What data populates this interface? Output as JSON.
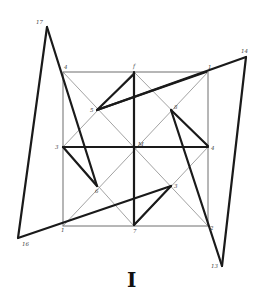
{
  "figure": {
    "caption": "I",
    "colors": {
      "thin_line": "#8a8a8a",
      "thick_line": "#1a1a1a",
      "label": "#444444",
      "background": "#ffffff"
    },
    "square": {
      "left": 63,
      "top": 72,
      "right": 208,
      "bottom": 226
    },
    "labels": [
      {
        "id": "p17",
        "text": "17",
        "x": 36,
        "y": 24
      },
      {
        "id": "p4a",
        "text": "4",
        "x": 64,
        "y": 69
      },
      {
        "id": "p15",
        "text": "5",
        "x": 90,
        "y": 112
      },
      {
        "id": "pf",
        "text": "f",
        "x": 133,
        "y": 68
      },
      {
        "id": "p1a",
        "text": "1",
        "x": 208,
        "y": 69
      },
      {
        "id": "p14",
        "text": "14",
        "x": 243,
        "y": 53
      },
      {
        "id": "p8",
        "text": "8",
        "x": 174,
        "y": 109
      },
      {
        "id": "p3a",
        "text": "3",
        "x": 55,
        "y": 149
      },
      {
        "id": "pM",
        "text": "M",
        "x": 139,
        "y": 146
      },
      {
        "id": "p4b",
        "text": "4",
        "x": 212,
        "y": 150
      },
      {
        "id": "p6",
        "text": "6",
        "x": 96,
        "y": 193
      },
      {
        "id": "p3b",
        "text": "3",
        "x": 174,
        "y": 188
      },
      {
        "id": "p1b",
        "text": "1",
        "x": 61,
        "y": 232
      },
      {
        "id": "p7",
        "text": "7",
        "x": 133,
        "y": 233
      },
      {
        "id": "p2",
        "text": "2",
        "x": 210,
        "y": 230
      },
      {
        "id": "p16",
        "text": "16",
        "x": 22,
        "y": 246
      },
      {
        "id": "p13",
        "text": "13",
        "x": 203,
        "y": 268
      }
    ]
  }
}
